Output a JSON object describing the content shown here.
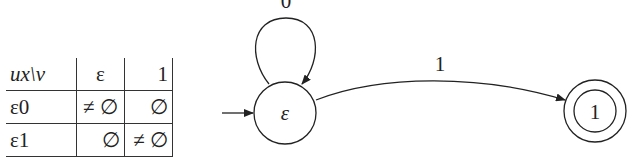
{
  "table": {
    "header": {
      "corner": "ux\\v",
      "columns": [
        "ε",
        "1"
      ]
    },
    "rows": [
      {
        "label": "ε0",
        "cells": [
          "≠ ∅",
          "∅"
        ]
      },
      {
        "label": "ε1",
        "cells": [
          "∅",
          "≠ ∅"
        ]
      }
    ]
  },
  "automaton": {
    "states": [
      {
        "id": "start",
        "label": "ε",
        "initial": true,
        "accepting": false
      },
      {
        "id": "one",
        "label": "1",
        "initial": false,
        "accepting": true
      }
    ],
    "transitions": [
      {
        "from": "ε",
        "to": "ε",
        "label": "0"
      },
      {
        "from": "ε",
        "to": "1",
        "label": "1"
      }
    ]
  }
}
